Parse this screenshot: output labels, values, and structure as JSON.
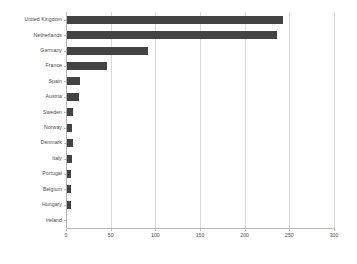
{
  "chart": {
    "type": "bar",
    "orientation": "horizontal",
    "bar_color": "#434343",
    "grid_color": "#d9d9d9",
    "axis_color": "#b8b8b8",
    "background": "#ffffff"
  },
  "chart_data": {
    "type": "bar",
    "title": "",
    "xlabel": "",
    "ylabel": "",
    "orientation": "horizontal",
    "grid": true,
    "legend": false,
    "xlim": [
      0,
      300
    ],
    "xticks": [
      0,
      50,
      100,
      150,
      200,
      250,
      300
    ],
    "xticklabels": [
      "0",
      "50",
      "100",
      "150",
      "200",
      "250",
      "300"
    ],
    "categories": [
      "United Kingdom",
      "Netherlands",
      "Germany",
      "France",
      "Spain",
      "Austria",
      "Sweden",
      "Norway",
      "Denmark",
      "Italy",
      "Portugal",
      "Belgium",
      "Hungary",
      "Ireland"
    ],
    "values": [
      243,
      236,
      92,
      46,
      16,
      15,
      8,
      7,
      8,
      7,
      6,
      6,
      6,
      1
    ]
  }
}
